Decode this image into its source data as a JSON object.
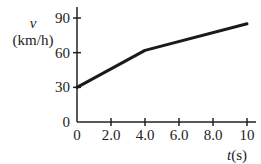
{
  "chart_data": {
    "type": "line",
    "title": "",
    "xlabel": "t(s)",
    "ylabel": "v (km/h)",
    "ylabel_symbol": "v",
    "ylabel_unit": "(km/h)",
    "xlabel_symbol": "t",
    "xlabel_unit": "(s)",
    "x_ticks": [
      "0",
      "2.0",
      "4.0",
      "6.0",
      "8.0",
      "10"
    ],
    "y_ticks": [
      "0",
      "30",
      "60",
      "90"
    ],
    "xlim": [
      0,
      10
    ],
    "ylim": [
      0,
      90
    ],
    "grid": false,
    "legend": null,
    "series": [
      {
        "name": "velocity",
        "x": [
          0,
          4.0,
          10
        ],
        "y": [
          30,
          62,
          85
        ],
        "color": "#1a1a1a"
      }
    ]
  }
}
